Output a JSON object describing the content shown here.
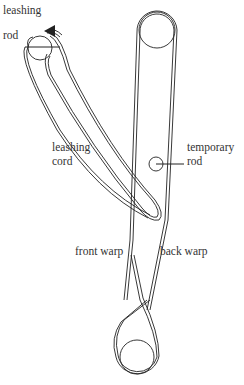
{
  "diagram": {
    "type": "backstrap loom warp setup",
    "labels": {
      "leashing_rod": [
        "leashing",
        "rod"
      ],
      "leashing_cord": [
        "leashing",
        "cord"
      ],
      "temporary_rod": [
        "temporary",
        "rod"
      ],
      "front_warp": "front warp",
      "back_warp": "back warp"
    },
    "colors": {
      "line": "#222222",
      "text": "#333333",
      "background": "#ffffff"
    }
  }
}
